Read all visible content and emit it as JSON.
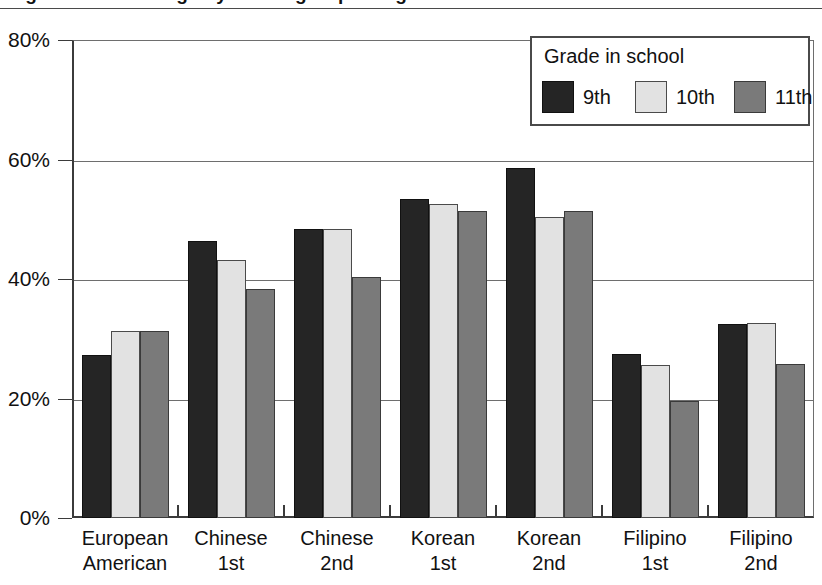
{
  "figure": {
    "title_partial": "Figure 1. Percentage by ethnic group and grade",
    "width": 822,
    "height": 585
  },
  "chart_data": {
    "type": "bar",
    "title": "",
    "xlabel": "",
    "ylabel": "",
    "ylim": [
      0,
      80
    ],
    "y_tick_labels": [
      "0%",
      "20%",
      "40%",
      "60%",
      "80%"
    ],
    "y_ticks": [
      0,
      20,
      40,
      60,
      80
    ],
    "grid": true,
    "legend_title": "Grade in school",
    "legend_position": "top-right",
    "categories": [
      "European American",
      "Chinese 1st",
      "Chinese 2nd",
      "Korean 1st",
      "Korean 2nd",
      "Filipino 1st",
      "Filipino 2nd"
    ],
    "category_lines": [
      [
        "European",
        "American"
      ],
      [
        "Chinese",
        "1st"
      ],
      [
        "Chinese",
        "2nd"
      ],
      [
        "Korean",
        "1st"
      ],
      [
        "Korean",
        "2nd"
      ],
      [
        "Filipino",
        "1st"
      ],
      [
        "Filipino",
        "2nd"
      ]
    ],
    "series": [
      {
        "name": "9th",
        "color": "#252525",
        "values": [
          27.2,
          46.3,
          48.4,
          53.4,
          58.5,
          27.5,
          32.5
        ]
      },
      {
        "name": "10th",
        "color": "#e2e2e2",
        "values": [
          31.3,
          43.2,
          48.4,
          52.5,
          50.4,
          25.6,
          32.7
        ]
      },
      {
        "name": "11th",
        "color": "#7a7a7a",
        "values": [
          31.3,
          38.4,
          40.3,
          51.4,
          51.4,
          19.6,
          25.7
        ]
      }
    ]
  }
}
